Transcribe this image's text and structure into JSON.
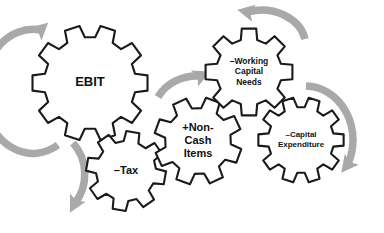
{
  "diagram": {
    "type": "gear-flow-diagram",
    "background_color": "#ffffff",
    "gear_outline_color": "#1a1a1a",
    "gear_fill_color": "#ffffff",
    "arrow_color": "#a9a9a9",
    "label_color": "#111111",
    "gears": [
      {
        "id": "ebit",
        "label": "EBIT",
        "lines": [
          "EBIT"
        ],
        "cx": 90,
        "cy": 83,
        "outer_radius": 58,
        "inner_radius": 46,
        "teeth": 10,
        "rotation": 0,
        "font_size": 13,
        "line_height": 15
      },
      {
        "id": "tax",
        "label": "–Tax",
        "lines": [
          "–Tax"
        ],
        "cx": 126,
        "cy": 171,
        "outer_radius": 40,
        "inner_radius": 30,
        "teeth": 8,
        "rotation": 10,
        "font_size": 11,
        "line_height": 13
      },
      {
        "id": "non-cash-items",
        "label": "+Non-Cash Items",
        "lines": [
          "+Non-",
          "Cash",
          "Items"
        ],
        "cx": 198,
        "cy": 141,
        "outer_radius": 44,
        "inner_radius": 33,
        "teeth": 8,
        "rotation": 20,
        "font_size": 11,
        "line_height": 13
      },
      {
        "id": "working-capital-needs",
        "label": "–Working Capital Needs",
        "lines": [
          "–Working",
          "Capital",
          "Needs"
        ],
        "cx": 249,
        "cy": 72,
        "outer_radius": 44,
        "inner_radius": 33,
        "teeth": 8,
        "rotation": 0,
        "font_size": 8.5,
        "line_height": 10.5
      },
      {
        "id": "capital-expenditure",
        "label": "–Capital Expenditure",
        "lines": [
          "–Capital",
          "Expenditure"
        ],
        "cx": 301,
        "cy": 140,
        "outer_radius": 43,
        "inner_radius": 33,
        "teeth": 10,
        "rotation": 0,
        "font_size": 8,
        "line_height": 10
      }
    ],
    "arrows": [
      {
        "id": "arrow-left-up",
        "description": "large arc on left curving counter-clockwise up toward EBIT gear",
        "path": "M 58 145 A 50 62 0 1 1 40 30",
        "head_x": 40,
        "head_y": 30,
        "head_angle": -42
      },
      {
        "id": "arrow-ebit-to-tax",
        "description": "short arc from EBIT down to Tax gear",
        "path": "M 73 143 A 40 44 0 0 1 75 203",
        "head_x": 75,
        "head_y": 203,
        "head_angle": 118
      },
      {
        "id": "arrow-tax-to-noncash",
        "description": "arc from Tax area rightward up to Working Capital gear",
        "path": "M 158 97 A 44 40 0 0 1 200 76",
        "head_x": 200,
        "head_y": 76,
        "head_angle": -24
      },
      {
        "id": "arrow-top-leftward",
        "description": "arc above gears pointing left toward Working Capital gear",
        "path": "M 305 39 A 44 36 0 0 0 248 12",
        "head_x": 248,
        "head_y": 12,
        "head_angle": 192
      },
      {
        "id": "arrow-right-down",
        "description": "arc on right curving clockwise down toward Capital Expenditure gear",
        "path": "M 306 86 A 48 54 0 0 1 348 164",
        "head_x": 348,
        "head_y": 164,
        "head_angle": 128
      }
    ]
  }
}
